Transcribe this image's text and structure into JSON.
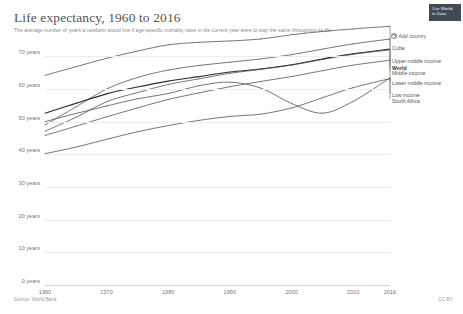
{
  "header": {
    "title": "Life expectancy, 1960 to 2016",
    "subtitle": "The average number of years a newborn would live if age-specific mortality rates in the current year were to stay the same throughout its life."
  },
  "branding": {
    "line1": "Our World",
    "line2": "in Data"
  },
  "controls": {
    "add_country_label": "Add country",
    "add_country_icon": "plus-circle-icon"
  },
  "footer": {
    "source": "Source: World Bank",
    "license": "CC BY"
  },
  "chart_data": {
    "type": "line",
    "title": "Life expectancy, 1960 to 2016",
    "xlabel": "",
    "ylabel": "years",
    "xlim": [
      1960,
      2016
    ],
    "ylim": [
      0,
      75
    ],
    "grid": true,
    "legend_position": "right",
    "y_ticks": [
      "0 years",
      "10 years",
      "20 years",
      "30 years",
      "40 years",
      "50 years",
      "60 years",
      "70 years"
    ],
    "y_tick_values": [
      0,
      10,
      20,
      30,
      40,
      50,
      60,
      70
    ],
    "x_ticks": [
      "1960",
      "1970",
      "1980",
      "1990",
      "2000",
      "2010",
      "2016"
    ],
    "x_tick_values": [
      1960,
      1970,
      1980,
      1990,
      2000,
      2010,
      2016
    ],
    "x": [
      1960,
      1965,
      1970,
      1975,
      1980,
      1985,
      1990,
      1995,
      2000,
      2005,
      2010,
      2016
    ],
    "series": [
      {
        "name": "Cuba",
        "emphasis": false,
        "values": [
          64.2,
          66.8,
          69.4,
          71.6,
          73.5,
          74.3,
          74.7,
          75.3,
          76.6,
          77.6,
          78.4,
          79.2
        ]
      },
      {
        "name": "Upper middle income",
        "emphasis": false,
        "values": [
          49.0,
          54.5,
          60.0,
          63.5,
          65.8,
          67.2,
          68.2,
          69.2,
          70.5,
          72.2,
          73.8,
          75.3
        ]
      },
      {
        "name": "World",
        "emphasis": true,
        "values": [
          52.6,
          55.6,
          58.5,
          60.6,
          62.4,
          63.8,
          65.2,
          66.1,
          67.4,
          69.2,
          70.8,
          72.2
        ]
      },
      {
        "name": "Middle income",
        "emphasis": false,
        "values": [
          47.1,
          51.3,
          56.1,
          58.9,
          61.4,
          63.1,
          64.8,
          66.0,
          67.3,
          69.0,
          70.6,
          72.0
        ]
      },
      {
        "name": "Lower middle income",
        "emphasis": false,
        "values": [
          45.8,
          48.6,
          51.5,
          54.2,
          56.8,
          58.8,
          60.7,
          62.3,
          63.8,
          65.6,
          67.3,
          68.8
        ]
      },
      {
        "name": "Low income",
        "emphasis": false,
        "values": [
          40.2,
          42.2,
          44.6,
          46.9,
          48.8,
          50.4,
          51.6,
          52.3,
          54.2,
          57.3,
          60.4,
          63.2
        ]
      },
      {
        "name": "South Africa",
        "emphasis": false,
        "values": [
          50.0,
          52.5,
          54.8,
          57.0,
          58.6,
          61.0,
          62.1,
          60.3,
          55.6,
          52.6,
          56.2,
          63.4
        ]
      }
    ],
    "legend_entries": [
      {
        "label": "Cuba",
        "bold": false
      },
      {
        "label": "Upper middle income",
        "bold": false
      },
      {
        "label": "World",
        "bold": true
      },
      {
        "label": "Middle income",
        "bold": false
      },
      {
        "label": "Lower middle income",
        "bold": false
      },
      {
        "label": "Low income",
        "bold": false
      },
      {
        "label": "South Africa",
        "bold": false
      }
    ]
  }
}
